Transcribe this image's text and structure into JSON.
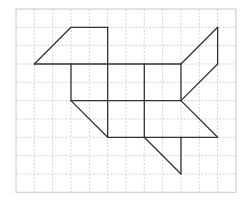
{
  "figure": {
    "type": "grid-drawing",
    "grid": {
      "cols": 12,
      "rows": 10,
      "origin_px": [
        16,
        9
      ],
      "cell_px": 18.33,
      "line_color": "#d4d4d4",
      "line_style": "dashed",
      "border_color": "#c8c8c8"
    },
    "shape": {
      "stroke_color": "#333333",
      "stroke_width": 1.3,
      "segments": [
        [
          [
            1,
            3
          ],
          [
            3,
            1
          ]
        ],
        [
          [
            3,
            1
          ],
          [
            5,
            1
          ]
        ],
        [
          [
            5,
            1
          ],
          [
            5,
            3
          ]
        ],
        [
          [
            1,
            3
          ],
          [
            9,
            3
          ]
        ],
        [
          [
            9,
            3
          ],
          [
            11,
            1
          ]
        ],
        [
          [
            11,
            1
          ],
          [
            11,
            3
          ]
        ],
        [
          [
            11,
            3
          ],
          [
            9,
            5
          ]
        ],
        [
          [
            3,
            3
          ],
          [
            3,
            5
          ]
        ],
        [
          [
            5,
            3
          ],
          [
            5,
            7
          ]
        ],
        [
          [
            7,
            3
          ],
          [
            7,
            7
          ]
        ],
        [
          [
            9,
            3
          ],
          [
            9,
            5
          ]
        ],
        [
          [
            3,
            5
          ],
          [
            9,
            5
          ]
        ],
        [
          [
            3,
            5
          ],
          [
            5,
            7
          ]
        ],
        [
          [
            5,
            7
          ],
          [
            11,
            7
          ]
        ],
        [
          [
            9,
            5
          ],
          [
            11,
            7
          ]
        ],
        [
          [
            7,
            7
          ],
          [
            9,
            9
          ]
        ],
        [
          [
            9,
            7
          ],
          [
            9,
            9
          ]
        ]
      ]
    }
  }
}
